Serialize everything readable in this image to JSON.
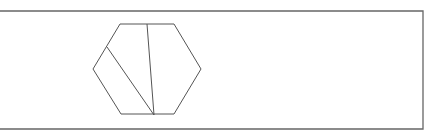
{
  "diagram": {
    "type": "geometry-figure",
    "colors": {
      "background": "#ffffff",
      "stroke": "#555555",
      "frame": "#666666"
    },
    "frame": {
      "top_y": 11,
      "bottom_y": 129,
      "right_x": 423,
      "left_x": 0
    },
    "hexagon": {
      "vertices": [
        [
          120,
          24
        ],
        [
          174,
          24
        ],
        [
          201,
          69
        ],
        [
          174,
          114
        ],
        [
          121,
          114
        ],
        [
          93,
          69
        ]
      ]
    },
    "segments": [
      {
        "name": "vertical-cut",
        "from": [
          147,
          24
        ],
        "to": [
          154,
          115
        ]
      },
      {
        "name": "diagonal-cut",
        "from": [
          107,
          47
        ],
        "to": [
          154,
          115
        ]
      }
    ]
  }
}
